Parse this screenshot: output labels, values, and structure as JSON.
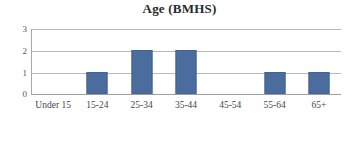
{
  "chart_data": {
    "type": "bar",
    "title": "Age (BMHS)",
    "xlabel": "",
    "ylabel": "",
    "categories": [
      "Under 15",
      "15-24",
      "25-34",
      "35-44",
      "45-54",
      "55-64",
      "65+"
    ],
    "values": [
      0,
      1,
      2,
      2,
      0,
      1,
      1
    ],
    "ylim": [
      0,
      3
    ],
    "yticks": [
      "0",
      "1",
      "2",
      "3"
    ],
    "grid": true,
    "legend": false,
    "legend_position": "none",
    "series": [
      {
        "name": "Age (BMHS)",
        "values": [
          0,
          1,
          2,
          2,
          0,
          1,
          1
        ]
      }
    ],
    "colors": {
      "bar": "#4a6d9e",
      "bar_border": "#44648f",
      "gridline": "#b9b9b9",
      "axis": "#9f9f9f",
      "title_text": "#2a2a2a",
      "tick_text": "#46464b",
      "background": "#ffffff"
    }
  }
}
